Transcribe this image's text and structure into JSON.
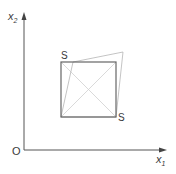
{
  "diagram": {
    "axes": {
      "x_label": "x",
      "x_subscript": "1",
      "y_label": "x",
      "y_subscript": "2",
      "origin_label": "O"
    },
    "labels": {
      "top_left_corner": "S",
      "bottom_right_corner": "S"
    },
    "colors": {
      "axis": "#555555",
      "square": "#666666",
      "outer_quad": "#b5b5b5",
      "diagonals": "#d0d0d0",
      "text": "#3a3a3a"
    }
  }
}
